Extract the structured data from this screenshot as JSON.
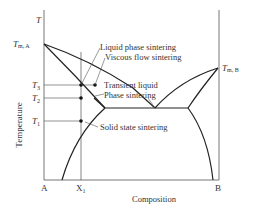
{
  "diagram": {
    "y_axis_symbol": "T",
    "y_axis_label": "Temperature",
    "x_axis_label": "Composition",
    "x_ticks": {
      "a": "A",
      "x1": "X",
      "x1_sub": "1",
      "b": "B"
    },
    "temps": {
      "tma": "T",
      "tma_sub": "m, A",
      "tmb": "T",
      "tmb_sub": "m, B",
      "t3": "T",
      "t3_sub": "3",
      "t2": "T",
      "t2_sub": "2",
      "t1": "T",
      "t1_sub": "1"
    },
    "annotations": {
      "liquid_phase": "Liquid phase sintering",
      "viscous_flow": "Viscous flow sintering",
      "transient_1": "Transient liquid",
      "transient_2": "Phase sintering",
      "solid_state": "Solid state sintering"
    },
    "colors": {
      "line": "#333333",
      "axis": "#555555"
    }
  }
}
